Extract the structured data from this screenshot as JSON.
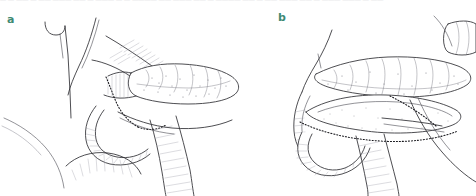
{
  "figure": {
    "type": "medical-line-illustration",
    "background_color": "#ffffff",
    "ink_color": "#2e2e33",
    "label_color": "#3f8a73",
    "top_caption_clipped": "— — —— — —— ——— —— — ——— — — ———— —— ——— —— — ———— —— — —— ——— —— — ——— ——— — ——"
  },
  "panels": [
    {
      "id": "a",
      "label": "a",
      "caption": "",
      "structures": [
        "pancreatic tail",
        "pancreatic body",
        "duodenal C-loop",
        "common bile duct",
        "suture line"
      ]
    },
    {
      "id": "b",
      "label": "b",
      "caption": "",
      "structures": [
        "opened pancreatic duct",
        "pancreatic body",
        "duodenal C-loop",
        "anastomosis suture line"
      ]
    }
  ]
}
